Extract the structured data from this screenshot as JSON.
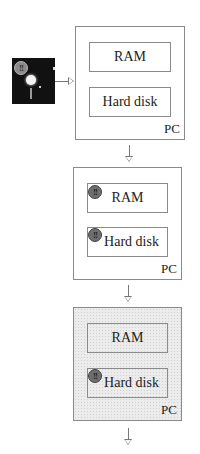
{
  "floppy": {
    "icon": "floppy-disk-icon",
    "virus_mark": "!!"
  },
  "stages": [
    {
      "pc_label": "PC",
      "ram_label": "RAM",
      "disk_label": "Hard disk",
      "ram_infected": false,
      "disk_infected": false,
      "pc_shaded": false
    },
    {
      "pc_label": "PC",
      "ram_label": "RAM",
      "disk_label": "Hard disk",
      "ram_infected": true,
      "disk_infected": true,
      "pc_shaded": false
    },
    {
      "pc_label": "PC",
      "ram_label": "RAM",
      "disk_label": "Hard disk",
      "ram_infected": false,
      "disk_infected": true,
      "pc_shaded": true
    }
  ],
  "virus_badge": "!!",
  "colors": {
    "line": "#777777",
    "border": "#8a8a8a",
    "badge": "#6e6e6e",
    "shade": "#ececec"
  }
}
